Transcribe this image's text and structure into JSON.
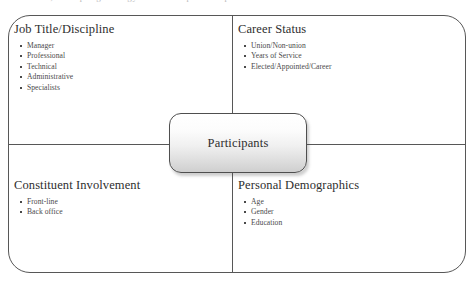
{
  "page": {
    "top_clipped_text": "the research, a sampling strategy was developed to capture the diverse"
  },
  "diagram": {
    "center": {
      "label": "Participants"
    },
    "quadrants": [
      {
        "id": "job-title",
        "title": "Job Title/Discipline",
        "items": [
          "Manager",
          "Professional",
          "Technical",
          "Administrative",
          "Specialists"
        ]
      },
      {
        "id": "career-status",
        "title": "Career Status",
        "items": [
          "Union/Non-union",
          "Years of Service",
          "Elected/Appointed/Career"
        ]
      },
      {
        "id": "constituent-involvement",
        "title": "Constituent Involvement",
        "items": [
          "Front-line",
          "Back office"
        ]
      },
      {
        "id": "personal-demographics",
        "title": "Personal Demographics",
        "items": [
          "Age",
          "Gender",
          "Education"
        ]
      }
    ]
  },
  "colors": {
    "line": "#575757",
    "title_text": "#2e2e2e",
    "body_text": "#4a4a4a",
    "node_fill_top": "#ffffff",
    "node_fill_bottom": "#cfcfcf",
    "background": "#ffffff"
  }
}
